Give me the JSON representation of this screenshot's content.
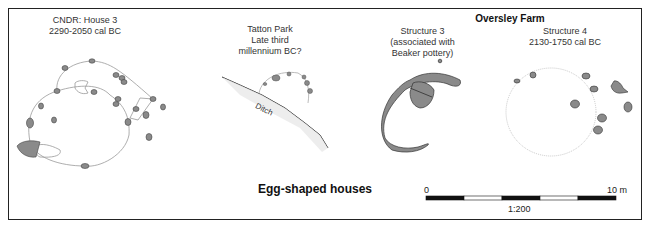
{
  "title": "Egg-shaped houses",
  "group_title": "Oversley Farm",
  "plans": [
    {
      "name": "CNDR: House 3",
      "date": "2290-2050 cal BC"
    },
    {
      "name": "Tatton Park",
      "date_line1": "Late third",
      "date_line2": "millennium BC?",
      "feature_label": "Ditch"
    },
    {
      "name": "Structure 3",
      "note_line1": "(associated with",
      "note_line2": "Beaker pottery)"
    },
    {
      "name": "Structure 4",
      "date": "2130-1750 cal BC"
    }
  ],
  "scale_bar": {
    "start_label": "0",
    "end_label": "10 m",
    "ratio": "1:200",
    "segments": 5
  },
  "colors": {
    "feature_fill": "#8a8a8a",
    "outline": "#333333",
    "guide_line": "#bbbbbb"
  }
}
